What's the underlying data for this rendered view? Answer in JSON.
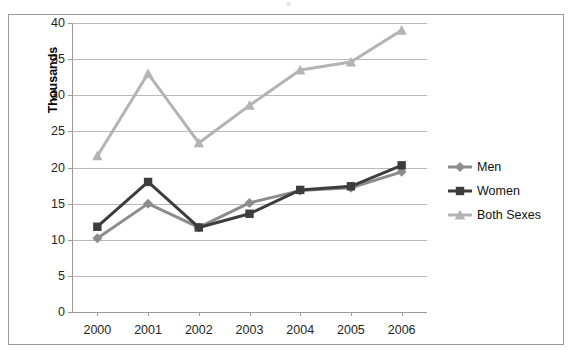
{
  "chart_data": {
    "type": "line",
    "title": "",
    "xlabel": "",
    "ylabel": "Thousands",
    "categories": [
      "2000",
      "2001",
      "2002",
      "2003",
      "2004",
      "2005",
      "2006"
    ],
    "x": [
      2000,
      2001,
      2002,
      2003,
      2004,
      2005,
      2006
    ],
    "ylim": [
      0,
      40
    ],
    "ytick_labels": [
      "0",
      "5",
      "10",
      "15",
      "20",
      "25",
      "30",
      "35",
      "40"
    ],
    "yticks": [
      0,
      5,
      10,
      15,
      20,
      25,
      30,
      35,
      40
    ],
    "grid": true,
    "legend_position": "right",
    "series": [
      {
        "name": "Men",
        "color": "#8c8c8c",
        "marker": "diamond",
        "values": [
          10.2,
          15.0,
          11.7,
          15.1,
          16.8,
          17.2,
          19.4
        ]
      },
      {
        "name": "Women",
        "color": "#3d3d3d",
        "marker": "square",
        "values": [
          11.8,
          18.0,
          11.7,
          13.6,
          16.9,
          17.4,
          20.3
        ]
      },
      {
        "name": "Both Sexes",
        "color": "#b3b3b3",
        "marker": "triangle",
        "values": [
          21.6,
          33.0,
          23.4,
          28.6,
          33.5,
          34.6,
          39.0
        ]
      }
    ]
  },
  "legend": {
    "items": [
      {
        "label": "Men"
      },
      {
        "label": "Women"
      },
      {
        "label": "Both Sexes"
      }
    ]
  },
  "colors": {
    "men": "#8c8c8c",
    "women": "#3d3d3d",
    "both_sexes": "#b3b3b3",
    "gridline": "#b9b9b9",
    "axis": "#9a9a9a",
    "border": "#9a9a9a",
    "text": "#1f1f1f"
  }
}
